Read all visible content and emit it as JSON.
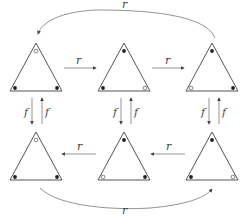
{
  "diagram": {
    "labels": {
      "r": "r",
      "f": "f"
    },
    "colors": {
      "stroke": "#555555",
      "dot": "#222222",
      "arrow": "#777777",
      "label": "#444444"
    },
    "triangles": [
      {
        "id": "top-1",
        "apex": [
          36,
          43
        ],
        "vertices": [
          "open",
          "filled",
          "filled"
        ]
      },
      {
        "id": "top-2",
        "apex": [
          124,
          43
        ],
        "vertices": [
          "filled",
          "filled",
          "open"
        ]
      },
      {
        "id": "top-3",
        "apex": [
          212,
          43
        ],
        "vertices": [
          "filled",
          "open",
          "filled"
        ]
      },
      {
        "id": "bottom-1",
        "apex": [
          36,
          132
        ],
        "vertices": [
          "open",
          "filled",
          "filled"
        ]
      },
      {
        "id": "bottom-2",
        "apex": [
          124,
          132
        ],
        "vertices": [
          "filled",
          "open",
          "filled"
        ]
      },
      {
        "id": "bottom-3",
        "apex": [
          212,
          132
        ],
        "vertices": [
          "filled",
          "filled",
          "open"
        ]
      }
    ],
    "edges": [
      {
        "from": "top-1",
        "to": "top-2",
        "label": "r"
      },
      {
        "from": "top-2",
        "to": "top-3",
        "label": "r"
      },
      {
        "from": "top-3",
        "to": "top-1",
        "label": "r",
        "curved": true
      },
      {
        "from": "bottom-3",
        "to": "bottom-2",
        "label": "r"
      },
      {
        "from": "bottom-2",
        "to": "bottom-1",
        "label": "r"
      },
      {
        "from": "bottom-1",
        "to": "bottom-3",
        "label": "r",
        "curved": true
      },
      {
        "from": "top-1",
        "to": "bottom-1",
        "label": "f"
      },
      {
        "from": "bottom-1",
        "to": "top-1",
        "label": "f"
      },
      {
        "from": "top-2",
        "to": "bottom-2",
        "label": "f"
      },
      {
        "from": "bottom-2",
        "to": "top-2",
        "label": "f"
      },
      {
        "from": "top-3",
        "to": "bottom-3",
        "label": "f"
      },
      {
        "from": "bottom-3",
        "to": "top-3",
        "label": "f"
      }
    ]
  }
}
